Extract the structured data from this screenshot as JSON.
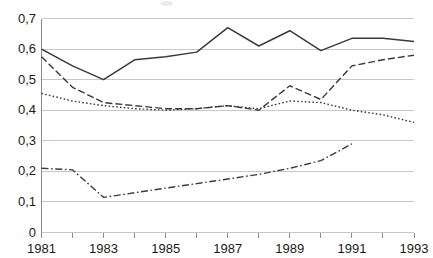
{
  "chart_data": {
    "type": "line",
    "title": "",
    "subtitle": "",
    "xlabel": "",
    "ylabel": "",
    "x": [
      1981,
      1982,
      1983,
      1984,
      1985,
      1986,
      1987,
      1988,
      1989,
      1990,
      1991,
      1992,
      1993
    ],
    "xlim": [
      1981,
      1993
    ],
    "ylim": [
      0,
      0.7
    ],
    "yticks": [
      0,
      0.1,
      0.2,
      0.3,
      0.4,
      0.5,
      0.6,
      0.7
    ],
    "ytick_labels": [
      "0",
      "0,1",
      "0,2",
      "0,3",
      "0,4",
      "0,5",
      "0,6",
      "0,7"
    ],
    "xticks": [
      1981,
      1982,
      1983,
      1984,
      1985,
      1986,
      1987,
      1988,
      1989,
      1990,
      1991,
      1992,
      1993
    ],
    "xtick_labels": [
      "1981",
      "",
      "1983",
      "",
      "1985",
      "",
      "1987",
      "",
      "1989",
      "",
      "1991",
      "",
      "1993"
    ],
    "xtick_labels_shown": [
      "1981",
      "1983",
      "1985",
      "1987",
      "1989",
      "1991",
      "1993"
    ],
    "decimal_separator": ",",
    "grid": true,
    "grid_axis": "y",
    "grid_color": "#c8c8c8",
    "axis_color": "#8c8c8c",
    "background": "#ffffff",
    "legend": "none",
    "legend_position": "none",
    "series": [
      {
        "name": "series-1",
        "style": "solid",
        "color": "#3a3a3a",
        "values": [
          0.6,
          0.545,
          0.5,
          0.565,
          0.575,
          0.59,
          0.67,
          0.61,
          0.66,
          0.595,
          0.635,
          0.635,
          0.625
        ]
      },
      {
        "name": "series-2",
        "style": "dashed",
        "color": "#3a3a3a",
        "values": [
          0.575,
          0.475,
          0.425,
          0.415,
          0.405,
          0.405,
          0.415,
          0.4,
          0.48,
          0.435,
          0.545,
          0.565,
          0.58
        ]
      },
      {
        "name": "series-3",
        "style": "dotted",
        "color": "#3a3a3a",
        "values": [
          0.455,
          0.43,
          0.415,
          0.405,
          0.4,
          0.405,
          0.415,
          0.405,
          0.43,
          0.425,
          0.4,
          0.385,
          0.36
        ]
      },
      {
        "name": "series-4",
        "style": "dash-dot",
        "color": "#3a3a3a",
        "values": [
          0.21,
          0.205,
          0.115,
          0.13,
          0.145,
          0.16,
          0.175,
          0.19,
          0.21,
          0.235,
          0.29,
          null,
          null
        ]
      }
    ]
  }
}
